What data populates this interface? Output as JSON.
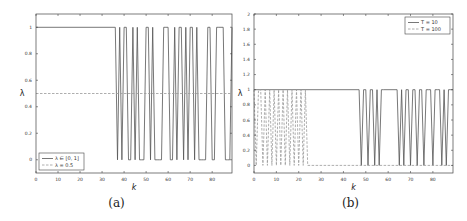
{
  "chart_data": [
    {
      "type": "line",
      "panel": "(a)",
      "caption": "(a)",
      "xlabel": "k",
      "ylabel": "λ",
      "xlim": [
        0,
        89
      ],
      "ylim": [
        -0.1,
        1.1
      ],
      "xticks": [
        0,
        10,
        20,
        30,
        40,
        50,
        60,
        70,
        80,
        90
      ],
      "yticks": [
        0,
        0.2,
        0.4,
        0.6,
        0.8,
        1
      ],
      "grid": false,
      "legend_position": "lower left",
      "series": [
        {
          "name": "λ ∈ [0, 1]",
          "style": "solid",
          "x": [
            0,
            36,
            37,
            38,
            39,
            40,
            41,
            42,
            43,
            44,
            45,
            46,
            47,
            48,
            49,
            50,
            51,
            52,
            53,
            54,
            55,
            56,
            57,
            58,
            59,
            60,
            61,
            62,
            63,
            64,
            65,
            66,
            67,
            68,
            69,
            70,
            71,
            72,
            73,
            74,
            75,
            76,
            77,
            78,
            79,
            80,
            81,
            82,
            83,
            84,
            85,
            86,
            87,
            88,
            89
          ],
          "values": [
            1,
            1,
            0,
            1,
            0,
            1,
            1,
            0,
            0,
            1,
            0,
            1,
            0,
            0,
            0,
            1,
            1,
            0,
            1,
            0,
            0,
            0,
            0,
            1,
            1,
            1,
            0,
            0,
            1,
            0,
            1,
            1,
            0,
            1,
            0,
            1,
            1,
            0,
            1,
            0,
            0,
            0,
            0,
            1,
            1,
            0,
            0,
            1,
            1,
            1,
            1,
            0,
            0,
            0,
            1
          ]
        },
        {
          "name": "λ = 0.5",
          "style": "dashed",
          "x": [
            0,
            89
          ],
          "values": [
            0.5,
            0.5
          ]
        }
      ]
    },
    {
      "type": "line",
      "panel": "(b)",
      "caption": "(b)",
      "xlabel": "k",
      "ylabel": "λ",
      "xlim": [
        0,
        89
      ],
      "ylim": [
        -0.1,
        2
      ],
      "xticks": [
        0,
        10,
        20,
        30,
        40,
        50,
        60,
        70,
        80
      ],
      "yticks": [
        0,
        0.2,
        0.4,
        0.6,
        0.8,
        1,
        1.2,
        1.4,
        1.6,
        1.8,
        2
      ],
      "grid": false,
      "legend_position": "upper right",
      "series": [
        {
          "name": "T = 10",
          "style": "solid",
          "x": [
            0,
            47,
            48,
            49,
            50,
            51,
            52,
            53,
            54,
            55,
            56,
            57,
            58,
            64,
            65,
            66,
            67,
            68,
            69,
            70,
            71,
            72,
            73,
            74,
            75,
            76,
            77,
            78,
            79,
            80,
            81,
            82,
            83,
            84,
            85,
            86,
            87,
            88,
            89
          ],
          "values": [
            1,
            1,
            0,
            1,
            1,
            0,
            1,
            1,
            0,
            1,
            0,
            1,
            1,
            1,
            0,
            1,
            0,
            1,
            1,
            0,
            1,
            1,
            0,
            1,
            1,
            0,
            1,
            1,
            1,
            0,
            1,
            1,
            1,
            0,
            1,
            0,
            1,
            1,
            1
          ]
        },
        {
          "name": "T = 100",
          "style": "dashed",
          "x": [
            0,
            1,
            2,
            3,
            4,
            5,
            6,
            7,
            8,
            9,
            10,
            11,
            12,
            13,
            14,
            15,
            16,
            17,
            18,
            19,
            20,
            21,
            22,
            23,
            24,
            89
          ],
          "values": [
            1,
            0,
            1,
            1,
            0,
            1,
            0,
            1,
            0,
            1,
            0,
            1,
            0,
            1,
            0,
            1,
            0,
            1,
            0,
            1,
            0,
            1,
            0,
            1,
            0,
            0
          ]
        }
      ]
    }
  ]
}
